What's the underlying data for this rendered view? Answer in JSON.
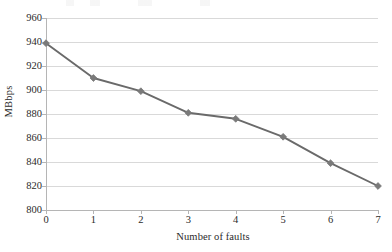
{
  "chart_data": {
    "type": "line",
    "title": "",
    "xlabel": "Number of faults",
    "ylabel": "MBbps",
    "x": [
      0,
      1,
      2,
      3,
      4,
      5,
      6,
      7
    ],
    "values": [
      939,
      910,
      899,
      881,
      876,
      861,
      839,
      820
    ],
    "series": [
      {
        "name": "throughput",
        "values": [
          939,
          910,
          899,
          881,
          876,
          861,
          839,
          820
        ]
      }
    ],
    "xtick_labels": [
      "0",
      "1",
      "2",
      "3",
      "4",
      "5",
      "6",
      "7"
    ],
    "ytick_labels": [
      "800",
      "820",
      "840",
      "860",
      "880",
      "900",
      "920",
      "940",
      "960"
    ],
    "ytick_values": [
      800,
      820,
      840,
      860,
      880,
      900,
      920,
      940,
      960
    ],
    "xlim": [
      0,
      7
    ],
    "ylim": [
      800,
      960
    ],
    "grid": "horizontal",
    "legend": "none",
    "marker": "diamond",
    "line_color": "#6a6a6a",
    "marker_color": "#7a7a7a",
    "grid_color": "#d9d9d9",
    "axis_color": "#b5b5b5",
    "text_color": "#2b2b2b"
  }
}
